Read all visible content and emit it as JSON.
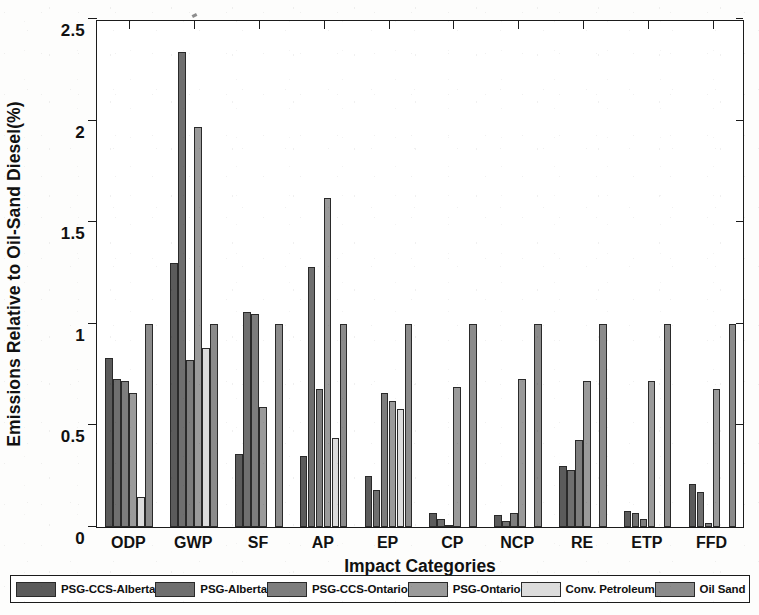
{
  "chart_data": {
    "type": "bar",
    "title": "",
    "xlabel": "Impact Categories",
    "ylabel": "Emissions Relative to Oil-Sand Diesel(%)",
    "ylim": [
      0,
      2.5
    ],
    "ytick_labels": [
      "0",
      "0.5",
      "1",
      "1.5",
      "2",
      "2.5"
    ],
    "yticks": [
      0,
      0.5,
      1,
      1.5,
      2,
      2.5
    ],
    "grid": false,
    "legend_position": "bottom",
    "categories": [
      "ODP",
      "GWP",
      "SF",
      "AP",
      "EP",
      "CP",
      "NCP",
      "RE",
      "ETP",
      "FFD"
    ],
    "series": [
      {
        "name": "PSG-CCS-Alberta",
        "color": "#5b5b5b",
        "values": [
          0.83,
          1.3,
          0.36,
          0.35,
          0.25,
          0.07,
          0.06,
          0.3,
          0.08,
          0.21
        ]
      },
      {
        "name": "PSG-Alberta",
        "color": "#6f6f6f",
        "values": [
          0.73,
          2.34,
          1.06,
          1.28,
          0.18,
          0.04,
          0.03,
          0.28,
          0.07,
          0.17
        ]
      },
      {
        "name": "PSG-CCS-Ontario",
        "color": "#7d7d7d",
        "values": [
          0.72,
          0.82,
          1.05,
          0.68,
          0.66,
          0.01,
          0.07,
          0.43,
          0.04,
          0.02
        ]
      },
      {
        "name": "PSG-Ontario",
        "color": "#9a9a9a",
        "values": [
          0.66,
          1.97,
          0.59,
          1.62,
          0.62,
          0.69,
          0.73,
          0.72,
          0.72,
          0.68
        ]
      },
      {
        "name": "Conv. Petroleum",
        "color": "#dcdcdc",
        "values": [
          0.15,
          0.88,
          0.0,
          0.44,
          0.58,
          0.0,
          0.0,
          0.0,
          0.0,
          0.0
        ]
      },
      {
        "name": "Oil Sand",
        "color": "#8b8b8b",
        "values": [
          1.0,
          1.0,
          1.0,
          1.0,
          1.0,
          1.0,
          1.0,
          1.0,
          1.0,
          1.0
        ]
      }
    ]
  },
  "axes": {
    "y_title": "Emissions Relative to Oil-Sand Diesel(%)",
    "x_title": "Impact Categories"
  },
  "legend": {
    "entries": [
      {
        "label": "PSG-CCS-Alberta",
        "color": "#5b5b5b"
      },
      {
        "label": "PSG-Alberta",
        "color": "#6f6f6f"
      },
      {
        "label": "PSG-CCS-Ontario",
        "color": "#7d7d7d"
      },
      {
        "label": "PSG-Ontario",
        "color": "#9a9a9a"
      },
      {
        "label": "Conv. Petroleum",
        "color": "#dcdcdc"
      },
      {
        "label": "Oil Sand",
        "color": "#8b8b8b"
      }
    ]
  }
}
